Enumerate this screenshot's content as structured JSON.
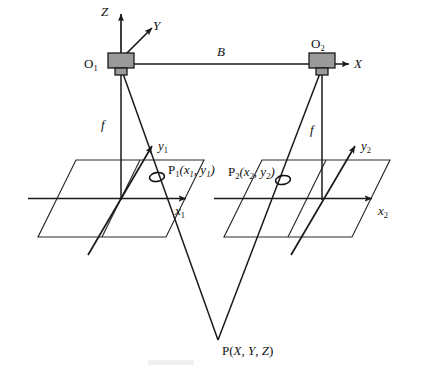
{
  "figure": {
    "type": "geometry-diagram",
    "background_color": "#ffffff",
    "line_color": "#1a1a1a",
    "camera_fill_color": "#9a9a9a"
  },
  "world_axes": {
    "z_label": "Z",
    "y_label": "Y",
    "x_label": "X"
  },
  "cameras": {
    "left": {
      "origin_label": "O",
      "origin_sub": "1",
      "focal_label": "f"
    },
    "right": {
      "origin_label": "O",
      "origin_sub": "2",
      "focal_label": "f"
    }
  },
  "baseline": {
    "label": "B"
  },
  "image_planes": {
    "left": {
      "x_axis_label": "x",
      "x_axis_sub": "1",
      "y_axis_label": "y",
      "y_axis_sub": "1",
      "point_label": "P",
      "point_sub": "1",
      "point_coords": "(x",
      "point_coords_sub1": "1",
      "point_coords_mid": ", y",
      "point_coords_sub2": "1",
      "point_coords_end": ")",
      "point_full_label": "P1(x1, y1)"
    },
    "right": {
      "x_axis_label": "x",
      "x_axis_sub": "2",
      "y_axis_label": "y",
      "y_axis_sub": "2",
      "point_label": "P",
      "point_sub": "2",
      "point_coords": "(x",
      "point_coords_sub1": "2",
      "point_coords_mid": ", y",
      "point_coords_sub2": "2",
      "point_coords_end": ")",
      "point_full_label": "P2(x2, y2)"
    }
  },
  "object_point": {
    "label": "P",
    "coords_open": "(",
    "coord_x": "X",
    "sep1": ", ",
    "coord_y": "Y",
    "sep2": ", ",
    "coord_z": "Z",
    "coords_close": ")",
    "full_label": "P(X, Y, Z)"
  }
}
